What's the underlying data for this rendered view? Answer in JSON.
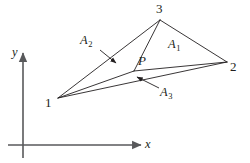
{
  "figure": {
    "type": "geometry-diagram",
    "colors": {
      "line": "#231f20",
      "axis": "#58595b",
      "text": "#231f20",
      "background": "#ffffff"
    },
    "vertices": [
      {
        "id": "v1",
        "label": "1",
        "x": 58,
        "y": 98,
        "label_x": 45,
        "label_y": 96
      },
      {
        "id": "v2",
        "label": "2",
        "x": 227,
        "y": 62,
        "label_x": 230,
        "label_y": 60
      },
      {
        "id": "v3",
        "label": "3",
        "x": 160,
        "y": 20,
        "label_x": 156,
        "label_y": 2
      }
    ],
    "interior_point": {
      "id": "P",
      "label": "P",
      "x": 134,
      "y": 71,
      "label_x": 138,
      "label_y": 54
    },
    "areas": [
      {
        "id": "A1",
        "label": "A",
        "subscript": "1",
        "label_x": 168,
        "label_y": 38,
        "has_leader": false
      },
      {
        "id": "A2",
        "label": "A",
        "subscript": "2",
        "label_x": 80,
        "label_y": 34,
        "has_leader": true,
        "leader_from_x": 100,
        "leader_from_y": 50,
        "leader_to_x": 116,
        "leader_to_y": 63
      },
      {
        "id": "A3",
        "label": "A",
        "subscript": "3",
        "label_x": 160,
        "label_y": 86,
        "has_leader": true,
        "leader_from_x": 159,
        "leader_from_y": 88,
        "leader_to_x": 137,
        "leader_to_y": 77
      }
    ],
    "axes": {
      "x_axis": {
        "label": "x",
        "label_x": 145,
        "label_y": 138,
        "start_x": 8,
        "start_y": 145,
        "end_x": 141,
        "end_y": 145
      },
      "y_axis": {
        "label": "y",
        "label_x": 12,
        "label_y": 46,
        "start_x": 23,
        "start_y": 158,
        "end_x": 23,
        "end_y": 53
      }
    }
  }
}
